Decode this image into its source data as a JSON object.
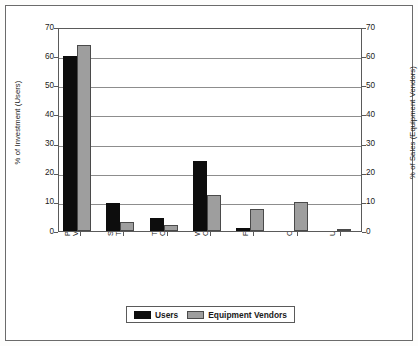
{
  "chart_data": {
    "type": "bar",
    "title": "",
    "xlabel": "",
    "ylabel": "% of Investment (Users)",
    "ylabel_right": "% of Sales (Equipment Vendors)",
    "ylim": [
      0,
      70
    ],
    "ylim_right": [
      0,
      70
    ],
    "ytick_step": 10,
    "yticks": [
      0,
      10,
      20,
      30,
      40,
      50,
      60,
      70
    ],
    "yticks_right": [
      0,
      10,
      20,
      30,
      40,
      50,
      60,
      70
    ],
    "grid": true,
    "grid_axis": "y",
    "legend_position": "bottom-center",
    "categories": [
      "Process Vents",
      "Storage Tanks",
      "Transfer Operations",
      "Wastewater Operations",
      "Fugitives",
      "Other",
      "Uncertain"
    ],
    "category_lines": [
      [
        "Process",
        "Vents"
      ],
      [
        "Storage",
        "Tanks"
      ],
      [
        "Transfer",
        "Operations"
      ],
      [
        "Wastewater",
        "Operations"
      ],
      [
        "Fugitives",
        ""
      ],
      [
        "Other",
        ""
      ],
      [
        "Uncertain",
        ""
      ]
    ],
    "series": [
      {
        "name": "Users",
        "color": "#0d0d0d",
        "axis": "left",
        "values": [
          60,
          9.7,
          4.5,
          24,
          1,
          0,
          0
        ]
      },
      {
        "name": "Equipment Vendors",
        "color": "#9e9e9e",
        "axis": "right",
        "values": [
          64,
          3,
          2,
          12.3,
          7.5,
          10,
          0.5
        ]
      }
    ]
  },
  "legend": {
    "items": [
      {
        "label": "Users",
        "swatch": "users"
      },
      {
        "label": "Equipment Vendors",
        "swatch": "vendors"
      }
    ]
  }
}
